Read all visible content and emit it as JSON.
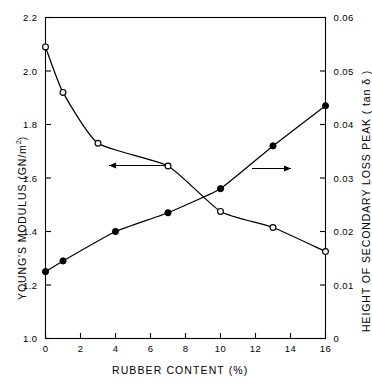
{
  "chart_data": {
    "type": "scatter",
    "title": "",
    "xlabel": "RUBBER CONTENT (%)",
    "ylabel": "YOUNG'S MODULUS  (GN/m2)",
    "ylabel_right": "HEIGHT OF SECONDARY LOSS PEAK  ( tan δ )",
    "xlim": [
      0,
      16
    ],
    "ylim": [
      1.0,
      2.2
    ],
    "ylim_right": [
      0,
      0.06
    ],
    "xticks": [
      "0",
      "2",
      "4",
      "6",
      "8",
      "10",
      "12",
      "14",
      "16"
    ],
    "xtick_values": [
      0,
      2,
      4,
      6,
      8,
      10,
      12,
      14,
      16
    ],
    "yticks": [
      "1.0",
      "1.2",
      "1.4",
      "1.6",
      "1.8",
      "2.0",
      "2.2"
    ],
    "ytick_values": [
      1.0,
      1.2,
      1.4,
      1.6,
      1.8,
      2.0,
      2.2
    ],
    "yticks_right": [
      "0",
      "0.01",
      "0.02",
      "0.03",
      "0.04",
      "0.05",
      "0.06"
    ],
    "ytick_values_right": [
      0,
      0.01,
      0.02,
      0.03,
      0.04,
      0.05,
      0.06
    ],
    "grid": false,
    "legend": "none",
    "series": [
      {
        "name": "YOUNG'S MODULUS",
        "marker": "open-circle",
        "axis": "left",
        "x": [
          0,
          1,
          3,
          7,
          10,
          13,
          16
        ],
        "values": [
          2.09,
          1.92,
          1.73,
          1.645,
          1.475,
          1.415,
          1.325
        ]
      },
      {
        "name": "HEIGHT OF SECONDARY LOSS PEAK",
        "marker": "filled-circle",
        "axis": "right",
        "x": [
          0,
          1,
          4,
          7,
          10,
          13,
          16
        ],
        "values": [
          0.0125,
          0.0145,
          0.02,
          0.0235,
          0.028,
          0.036,
          0.0435
        ]
      }
    ],
    "annotations": [
      {
        "name": "left-axis-arrow",
        "label": "arrow pointing to left axis",
        "direction": "left"
      },
      {
        "name": "right-axis-arrow",
        "label": "arrow pointing to right axis",
        "direction": "right"
      }
    ]
  },
  "axes": {
    "x_title": "RUBBER CONTENT (%)",
    "y_left_title_main": "YOUNG'S MODULUS  (GN/m",
    "y_left_title_sup": "2",
    "y_left_title_tail": ")",
    "y_right_title": "HEIGHT OF SECONDARY LOSS PEAK  ( tan δ )"
  },
  "style": {
    "axis_color": "#000000",
    "curve_color": "#000000",
    "background": "#ffffff"
  }
}
